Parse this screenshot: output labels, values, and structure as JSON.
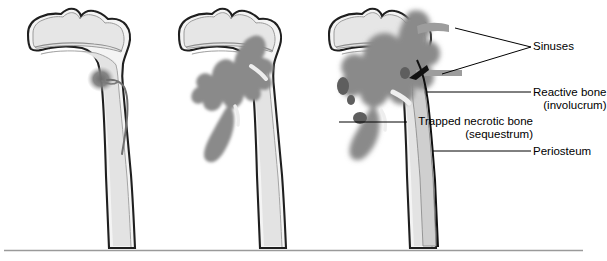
{
  "figure": {
    "type": "medical-illustration",
    "background_color": "#ffffff",
    "divider_line_color": "#9a9a9a",
    "bone_outline_color": "#1a1a1a",
    "cortex_fill_color": "#f2f2f2",
    "medulla_fill_color": "#e0e0e0",
    "epiphysis_fill_color": "#e4e4e4",
    "infection_color": "#8a8a8a",
    "necrotic_dark_color": "#5e5e5e",
    "sinus_tract_color": "#9d9d9d",
    "leader_line_color": "#000000"
  },
  "panels": [
    {
      "id": "panel-1",
      "stage_number": 1,
      "stage_name": "Early focal infection",
      "description": "Small focus of infection in the metaphysis with a nutrient vessel"
    },
    {
      "id": "panel-2",
      "stage_number": 2,
      "stage_name": "Spreading infection",
      "description": "Infection spreads through the medullary canal of the metaphysis and diaphysis"
    },
    {
      "id": "panel-3",
      "stage_number": 3,
      "stage_name": "Chronic osteomyelitis",
      "description": "Infection breaches the cortex forming sinuses, involucrum and sequestrum"
    }
  ],
  "labels": [
    {
      "id": "sinuses",
      "text": "Sinuses",
      "sub": "",
      "leader_from": [
        533,
        47
      ],
      "leader_to": [
        [
          455,
          28
        ],
        [
          440,
          74
        ]
      ]
    },
    {
      "id": "reactive-bone",
      "text": "Reactive bone",
      "sub": "(involucrum)",
      "leader_from": [
        531,
        92
      ],
      "leader_to": [
        [
          427,
          92
        ]
      ]
    },
    {
      "id": "trapped-necrotic-bone",
      "text": "Trapped necrotic bone",
      "sub": "(sequestrum)",
      "leader_from": [
        408,
        122
      ],
      "leader_to": [
        [
          339,
          122
        ]
      ]
    },
    {
      "id": "periosteum",
      "text": "Periosteum",
      "sub": "",
      "leader_from": [
        531,
        151
      ],
      "leader_to": [
        [
          433,
          151
        ]
      ]
    }
  ]
}
